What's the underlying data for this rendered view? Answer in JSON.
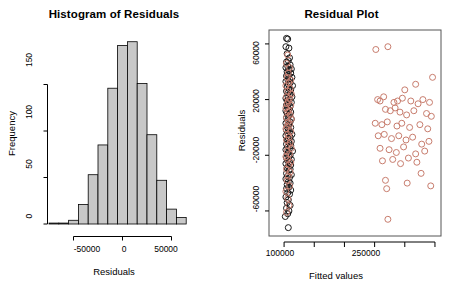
{
  "figure": {
    "background": "#ffffff",
    "panels": [
      "histogram-of-residuals",
      "residual-plot"
    ]
  },
  "chart_data": [
    {
      "type": "bar",
      "id": "histogram-of-residuals",
      "title": "Histogram of Residuals",
      "xlabel": "Residuals",
      "ylabel": "Frequency",
      "xlim": [
        -75000,
        75000
      ],
      "ylim": [
        0,
        200
      ],
      "grid": false,
      "legend": null,
      "bin_width": 10000,
      "bar_fill": "#c8c8c8",
      "bar_border": "#000000",
      "xticks": [
        -50000,
        0,
        50000
      ],
      "xtick_labels": [
        "-50000",
        "0",
        "50000"
      ],
      "yticks": [
        0,
        50,
        100,
        150
      ],
      "ytick_labels": [
        "0",
        "50",
        "100",
        "150"
      ],
      "categories": [
        "-70000",
        "-60000",
        "-50000",
        "-40000",
        "-30000",
        "-20000",
        "-10000",
        "0",
        "10000",
        "20000",
        "30000",
        "40000",
        "50000",
        "60000"
      ],
      "bin_edges": [
        -75000,
        -65000,
        -55000,
        -45000,
        -35000,
        -25000,
        -15000,
        -5000,
        5000,
        15000,
        25000,
        35000,
        45000,
        55000,
        65000
      ],
      "values": [
        1,
        1,
        4,
        21,
        53,
        85,
        146,
        192,
        196,
        151,
        96,
        47,
        16,
        7,
        2
      ]
    },
    {
      "type": "scatter",
      "id": "residual-plot",
      "title": "Residual Plot",
      "xlabel": "Fitted values",
      "ylabel": "Residuals",
      "xlim": [
        75000,
        360000
      ],
      "ylim": [
        -78000,
        70000
      ],
      "grid": false,
      "legend": null,
      "point_shape": "open-circle",
      "point_radius": 3,
      "xticks": [
        100000,
        150000,
        200000,
        250000,
        300000,
        350000
      ],
      "xtick_labels": [
        "100000",
        "",
        "",
        "250000",
        "",
        ""
      ],
      "xtick_labels_shown": [
        "100000",
        "250000"
      ],
      "yticks": [
        60000,
        20000,
        -20000,
        -60000
      ],
      "ytick_labels": [
        "60000",
        "20000",
        "-20000",
        "-60000"
      ],
      "series": [
        {
          "name": "cluster-black",
          "color": "#1a1a1a",
          "points": [
            [
              104000,
              64000
            ],
            [
              106000,
              63500
            ],
            [
              103000,
              58000
            ],
            [
              108000,
              57000
            ],
            [
              105000,
              53000
            ],
            [
              109000,
              50000
            ],
            [
              107000,
              48000
            ],
            [
              104000,
              47000
            ],
            [
              110000,
              45000
            ],
            [
              106000,
              44000
            ],
            [
              103000,
              43000
            ],
            [
              112000,
              42000
            ],
            [
              108000,
              41000
            ],
            [
              105000,
              40000
            ],
            [
              111000,
              39000
            ],
            [
              107000,
              38000
            ],
            [
              104000,
              37000
            ],
            [
              113000,
              36000
            ],
            [
              109000,
              35000
            ],
            [
              106000,
              34500
            ],
            [
              103000,
              33000
            ],
            [
              110000,
              32000
            ],
            [
              107000,
              31000
            ],
            [
              114000,
              30000
            ],
            [
              105000,
              29000
            ],
            [
              108000,
              28000
            ],
            [
              111000,
              27000
            ],
            [
              104000,
              26000
            ],
            [
              107000,
              25000
            ],
            [
              110000,
              24000
            ],
            [
              106000,
              23000
            ],
            [
              113000,
              22000
            ],
            [
              103000,
              21000
            ],
            [
              109000,
              20000
            ],
            [
              105000,
              19000
            ],
            [
              112000,
              18000
            ],
            [
              107000,
              17000
            ],
            [
              104000,
              16000
            ],
            [
              110000,
              15000
            ],
            [
              106000,
              14000
            ],
            [
              108000,
              13000
            ],
            [
              103000,
              12000
            ],
            [
              111000,
              11000
            ],
            [
              105000,
              10000
            ],
            [
              109000,
              9000
            ],
            [
              107000,
              8000
            ],
            [
              104000,
              7000
            ],
            [
              112000,
              6000
            ],
            [
              106000,
              5000
            ],
            [
              110000,
              4000
            ],
            [
              103000,
              3000
            ],
            [
              108000,
              2000
            ],
            [
              105000,
              1000
            ],
            [
              111000,
              0
            ],
            [
              107000,
              -1000
            ],
            [
              104000,
              -2000
            ],
            [
              109000,
              -3000
            ],
            [
              106000,
              -4000
            ],
            [
              113000,
              -5000
            ],
            [
              103000,
              -6000
            ],
            [
              110000,
              -7000
            ],
            [
              107000,
              -8000
            ],
            [
              105000,
              -9000
            ],
            [
              112000,
              -10000
            ],
            [
              108000,
              -11000
            ],
            [
              104000,
              -12000
            ],
            [
              111000,
              -13000
            ],
            [
              106000,
              -14000
            ],
            [
              109000,
              -15000
            ],
            [
              103000,
              -16000
            ],
            [
              114000,
              -17000
            ],
            [
              107000,
              -18000
            ],
            [
              105000,
              -19000
            ],
            [
              110000,
              -20000
            ],
            [
              108000,
              -21000
            ],
            [
              104000,
              -22000
            ],
            [
              112000,
              -23000
            ],
            [
              106000,
              -24000
            ],
            [
              109000,
              -25000
            ],
            [
              103000,
              -26000
            ],
            [
              111000,
              -27000
            ],
            [
              107000,
              -28000
            ],
            [
              105000,
              -29000
            ],
            [
              110000,
              -30000
            ],
            [
              108000,
              -31000
            ],
            [
              104000,
              -33000
            ],
            [
              112000,
              -34000
            ],
            [
              106000,
              -35000
            ],
            [
              109000,
              -36000
            ],
            [
              103000,
              -37000
            ],
            [
              107000,
              -39000
            ],
            [
              110000,
              -40000
            ],
            [
              105000,
              -41000
            ],
            [
              108000,
              -43000
            ],
            [
              104000,
              -44000
            ],
            [
              111000,
              -45000
            ],
            [
              106000,
              -47000
            ],
            [
              109000,
              -48000
            ],
            [
              103000,
              -50000
            ],
            [
              107000,
              -52000
            ],
            [
              105000,
              -54000
            ],
            [
              110000,
              -56000
            ],
            [
              104000,
              -58000
            ],
            [
              108000,
              -60000
            ],
            [
              106000,
              -62000
            ],
            [
              102000,
              -64000
            ],
            [
              107000,
              -72000
            ]
          ]
        },
        {
          "name": "cluster-red",
          "color": "#c87d6e",
          "points": [
            [
              106000,
              52000
            ],
            [
              104000,
              46000
            ],
            [
              109000,
              43000
            ],
            [
              107000,
              39000
            ],
            [
              105000,
              36000
            ],
            [
              111000,
              34000
            ],
            [
              108000,
              32000
            ],
            [
              103000,
              30000
            ],
            [
              110000,
              28000
            ],
            [
              106000,
              26000
            ],
            [
              112000,
              24000
            ],
            [
              104000,
              22000
            ],
            [
              109000,
              21000
            ],
            [
              107000,
              19000
            ],
            [
              105000,
              17000
            ],
            [
              111000,
              16000
            ],
            [
              103000,
              14000
            ],
            [
              108000,
              12000
            ],
            [
              106000,
              11000
            ],
            [
              110000,
              9000
            ],
            [
              104000,
              7000
            ],
            [
              112000,
              6000
            ],
            [
              107000,
              4000
            ],
            [
              109000,
              2000
            ],
            [
              105000,
              1000
            ],
            [
              103000,
              -1000
            ],
            [
              111000,
              -3000
            ],
            [
              106000,
              -5000
            ],
            [
              108000,
              -7000
            ],
            [
              104000,
              -9000
            ],
            [
              110000,
              -11000
            ],
            [
              107000,
              -13000
            ],
            [
              112000,
              -15000
            ],
            [
              105000,
              -17000
            ],
            [
              109000,
              -19000
            ],
            [
              103000,
              -21000
            ],
            [
              106000,
              -23000
            ],
            [
              111000,
              -25000
            ],
            [
              108000,
              -27000
            ],
            [
              104000,
              -30000
            ],
            [
              110000,
              -32000
            ],
            [
              107000,
              -35000
            ],
            [
              105000,
              -38000
            ],
            [
              109000,
              -42000
            ],
            [
              103000,
              -46000
            ],
            [
              106000,
              -51000
            ],
            [
              108000,
              -56000
            ],
            [
              104000,
              -61000
            ]
          ]
        },
        {
          "name": "high-fitted-red",
          "color": "#c87d6e",
          "points": [
            [
              252000,
              56000
            ],
            [
              272000,
              58000
            ],
            [
              346000,
              36000
            ],
            [
              300000,
              27000
            ],
            [
              318000,
              31000
            ],
            [
              255000,
              20000
            ],
            [
              259000,
              19000
            ],
            [
              265000,
              22000
            ],
            [
              282000,
              18000
            ],
            [
              288000,
              19000
            ],
            [
              296000,
              21000
            ],
            [
              310000,
              19000
            ],
            [
              322000,
              17000
            ],
            [
              330000,
              20000
            ],
            [
              341000,
              18000
            ],
            [
              268000,
              13000
            ],
            [
              276000,
              12000
            ],
            [
              284000,
              14000
            ],
            [
              292000,
              11000
            ],
            [
              303000,
              9000
            ],
            [
              315000,
              12000
            ],
            [
              336000,
              10000
            ],
            [
              344000,
              8000
            ],
            [
              251000,
              3000
            ],
            [
              262000,
              2000
            ],
            [
              271000,
              4000
            ],
            [
              287000,
              1000
            ],
            [
              295000,
              3000
            ],
            [
              308000,
              0
            ],
            [
              325000,
              2000
            ],
            [
              338000,
              -1000
            ],
            [
              256000,
              -6000
            ],
            [
              266000,
              -5000
            ],
            [
              278000,
              -8000
            ],
            [
              290000,
              -6000
            ],
            [
              302000,
              -9000
            ],
            [
              313000,
              -7000
            ],
            [
              328000,
              -12000
            ],
            [
              340000,
              -10000
            ],
            [
              259000,
              -15000
            ],
            [
              274000,
              -16000
            ],
            [
              286000,
              -18000
            ],
            [
              298000,
              -14000
            ],
            [
              318000,
              -19000
            ],
            [
              333000,
              -17000
            ],
            [
              263000,
              -24000
            ],
            [
              280000,
              -23000
            ],
            [
              293000,
              -26000
            ],
            [
              306000,
              -22000
            ],
            [
              320000,
              -25000
            ],
            [
              327000,
              -33000
            ],
            [
              268000,
              -38000
            ],
            [
              270000,
              -44000
            ],
            [
              304000,
              -40000
            ],
            [
              343000,
              -42000
            ],
            [
              272000,
              -66000
            ]
          ]
        }
      ]
    }
  ],
  "histogram_panel": {
    "title": "Histogram of Residuals",
    "x_axis_label": "Residuals",
    "y_axis_label": "Frequency",
    "x_tick_labels": [
      "-50000",
      "0",
      "50000"
    ],
    "y_tick_labels": [
      "150",
      "100",
      "50",
      "0"
    ]
  },
  "residual_panel": {
    "title": "Residual Plot",
    "x_axis_label": "Fitted values",
    "y_axis_label": "Residuals",
    "x_tick_labels": [
      "100000",
      "250000"
    ],
    "y_tick_labels": [
      "60000",
      "20000",
      "-20000",
      "-60000"
    ]
  }
}
